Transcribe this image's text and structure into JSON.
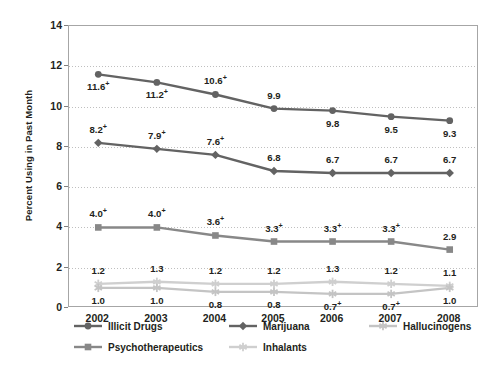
{
  "chart_data": {
    "type": "line",
    "title": "",
    "xlabel": "",
    "ylabel": "Percent Using in Past Month",
    "x": [
      "2002",
      "2003",
      "2004",
      "2005",
      "2006",
      "2007",
      "2008"
    ],
    "ylim": [
      0,
      14
    ],
    "yticks": [
      "0",
      "2",
      "4",
      "6",
      "8",
      "10",
      "12",
      "14"
    ],
    "grid": true,
    "legend_position": "bottom",
    "series": [
      {
        "name": "Illicit Drugs",
        "color": "#636363",
        "marker": "circle",
        "values": [
          11.6,
          11.2,
          10.6,
          9.9,
          9.8,
          9.5,
          9.3
        ],
        "labels": [
          "11.6+",
          "11.2+",
          "10.6+",
          "9.9",
          "9.8",
          "9.5",
          "9.3"
        ],
        "label_positions": [
          "below",
          "below",
          "above",
          "above",
          "below",
          "below",
          "below"
        ]
      },
      {
        "name": "Marijuana",
        "color": "#636363",
        "marker": "diamond",
        "values": [
          8.2,
          7.9,
          7.6,
          6.8,
          6.7,
          6.7,
          6.7
        ],
        "labels": [
          "8.2+",
          "7.9+",
          "7.6+",
          "6.8",
          "6.7",
          "6.7",
          "6.7"
        ],
        "label_positions": [
          "above",
          "above",
          "above",
          "above",
          "above",
          "above",
          "above"
        ]
      },
      {
        "name": "Psychotherapeutics",
        "color": "#888888",
        "marker": "square",
        "values": [
          4.0,
          4.0,
          3.6,
          3.3,
          3.3,
          3.3,
          2.9
        ],
        "labels": [
          "4.0+",
          "4.0+",
          "3.6+",
          "3.3+",
          "3.3+",
          "3.3+",
          "2.9"
        ],
        "label_positions": [
          "above",
          "above",
          "above",
          "above",
          "above",
          "above",
          "above"
        ]
      },
      {
        "name": "Inhalants",
        "color": "#cfcfcf",
        "marker": "asterisk",
        "values": [
          1.2,
          1.3,
          1.2,
          1.2,
          1.3,
          1.2,
          1.1
        ],
        "labels": [
          "1.2",
          "1.3",
          "1.2",
          "1.2",
          "1.3",
          "1.2",
          "1.1"
        ],
        "label_positions": [
          "above",
          "above",
          "above",
          "above",
          "above",
          "above",
          "above"
        ]
      },
      {
        "name": "Hallucinogens",
        "color": "#c4c4c4",
        "marker": "asterisk",
        "values": [
          1.0,
          1.0,
          0.8,
          0.8,
          0.7,
          0.7,
          1.0
        ],
        "labels": [
          "1.0",
          "1.0",
          "0.8",
          "0.8",
          "0.7+",
          "0.7+",
          "1.0"
        ],
        "label_positions": [
          "below",
          "below",
          "below",
          "below",
          "below",
          "below",
          "below"
        ]
      }
    ],
    "legend_entries": [
      {
        "name": "Illicit Drugs",
        "color": "#636363",
        "marker": "circle"
      },
      {
        "name": "Marijuana",
        "color": "#636363",
        "marker": "diamond"
      },
      {
        "name": "Hallucinogens",
        "color": "#c4c4c4",
        "marker": "asterisk"
      },
      {
        "name": "Psychotherapeutics",
        "color": "#888888",
        "marker": "square"
      },
      {
        "name": "Inhalants",
        "color": "#cfcfcf",
        "marker": "asterisk"
      }
    ]
  }
}
